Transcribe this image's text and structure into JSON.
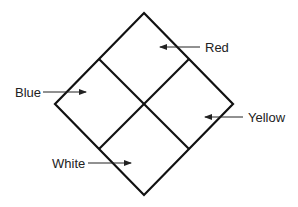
{
  "diagram": {
    "title": "",
    "labels": [
      {
        "id": "red",
        "text": "Red",
        "x": 205,
        "y": 52,
        "arrow": [
          200,
          47,
          160,
          47
        ]
      },
      {
        "id": "blue",
        "text": "Blue",
        "x": 15,
        "y": 97,
        "arrow": [
          43,
          92,
          86,
          92
        ]
      },
      {
        "id": "yellow",
        "text": "Yellow",
        "x": 248,
        "y": 122,
        "arrow": [
          243,
          117,
          205,
          117
        ]
      },
      {
        "id": "white",
        "text": "White",
        "x": 52,
        "y": 168,
        "arrow": [
          88,
          163,
          131,
          163
        ]
      }
    ],
    "line_color": "#111111"
  }
}
